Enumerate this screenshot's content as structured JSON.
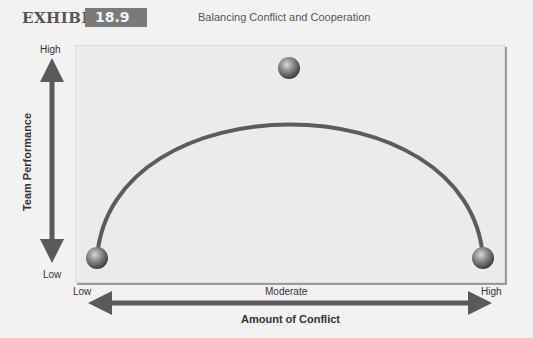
{
  "header": {
    "exhibit_label": "EXHIBIT",
    "exhibit_number": "18.9",
    "title": "Balancing Conflict and Cooperation"
  },
  "y_axis": {
    "title": "Team Performance",
    "high_label": "High",
    "low_label": "Low"
  },
  "x_axis": {
    "title": "Amount of Conflict",
    "low_label": "Low",
    "moderate_label": "Moderate",
    "high_label": "High"
  },
  "curve": {
    "shape": "inverted-U",
    "points": [
      {
        "conflict": "Low",
        "performance": "Low"
      },
      {
        "conflict": "Moderate",
        "performance": "High"
      },
      {
        "conflict": "High",
        "performance": "Low"
      }
    ]
  },
  "colors": {
    "arrow": "#5a5a5a",
    "curve": "#5c5c5c",
    "badge": "#7a7a7a",
    "panel": "#ebebeb"
  }
}
